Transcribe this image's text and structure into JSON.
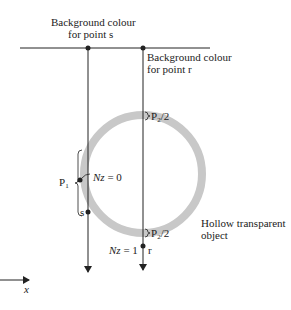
{
  "diagram": {
    "title": "",
    "labels": {
      "bg_s_line1": "Background colour",
      "bg_s_line2": "for point s",
      "bg_r_line1": "Background colour",
      "bg_r_line2": "for point r",
      "p2_top": "P",
      "p2_top_sub": "2",
      "p2_top_suffix": "/2",
      "p2_bottom": "P",
      "p2_bottom_sub": "2",
      "p2_bottom_suffix": "/2",
      "p1": "P",
      "p1_sub": "1",
      "nz0_var": "Nz",
      "nz0_val": " = 0",
      "nz1_var": "Nz",
      "nz1_val": " = 1",
      "point_s": "s",
      "point_r": "r",
      "object_line1": "Hollow transparent",
      "object_line2": "object",
      "axis_x": "x"
    },
    "colors": {
      "ring": "#c8c8c8",
      "ink": "#222222"
    }
  }
}
